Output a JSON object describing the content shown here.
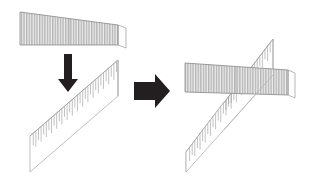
{
  "figure": {
    "title": "Assembly diagram: striped panel lowered onto fringed panel",
    "background_color": "#ffffff",
    "width": 311,
    "height": 182,
    "stage_labels": {
      "left_stage": "before",
      "right_stage": "after"
    }
  },
  "colors": {
    "stripe_fill": "#b4b4b4",
    "stripe_gap": "#ededed",
    "panel_outline": "#8c8c8c",
    "fringe_line": "#a8a8a8",
    "fringe_panel_outline": "#b0b0b0",
    "fringe_panel_fill": "#ffffff",
    "arrow_fill": "#231f20",
    "side_face_fill": "#fdfdfd",
    "side_face_outline": "#9a9a9a"
  },
  "elements": {
    "striped_panel_top": {
      "name": "striped panel",
      "stripe_count": 46,
      "points": "20,12 118,25 118,45 20,45",
      "quad": [
        [
          20,
          12
        ],
        [
          118,
          25
        ],
        [
          118,
          45
        ],
        [
          20,
          45
        ]
      ]
    },
    "striped_panel_top_edge_face": {
      "name": "panel end face",
      "quad": [
        [
          118,
          25
        ],
        [
          125,
          27
        ],
        [
          125,
          47
        ],
        [
          118,
          45
        ]
      ]
    },
    "fringed_panel_bottom_left": {
      "name": "fringed panel",
      "fringe_count": 40,
      "quad": [
        [
          30,
          136
        ],
        [
          118,
          60
        ],
        [
          118,
          96
        ],
        [
          30,
          172
        ]
      ]
    },
    "down_arrow": {
      "name": "downward arrow",
      "direction": "down",
      "tip": [
        68,
        90
      ],
      "tail": [
        68,
        54
      ]
    },
    "right_arrow": {
      "name": "rightward arrow",
      "direction": "right",
      "tip": [
        168,
        91
      ],
      "tail": [
        134,
        91
      ]
    },
    "result_striped_panel": {
      "name": "striped panel placed",
      "stripe_count": 46,
      "quad": [
        [
          185,
          63
        ],
        [
          288,
          70
        ],
        [
          288,
          95
        ],
        [
          185,
          92
        ]
      ]
    },
    "result_fringed_panel": {
      "name": "fringed panel placed",
      "fringe_count": 40,
      "quad": [
        [
          186,
          152
        ],
        [
          273,
          39
        ],
        [
          273,
          75
        ],
        [
          186,
          172
        ]
      ]
    }
  },
  "annotations": {
    "note_left": "",
    "note_right": ""
  }
}
